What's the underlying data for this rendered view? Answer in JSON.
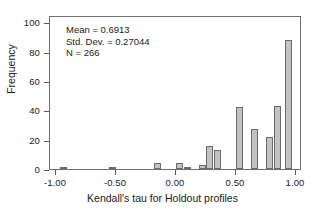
{
  "chart_data": {
    "type": "bar",
    "title": "",
    "subtitle": "",
    "xlabel": "Kendall's tau for Holdout profiles",
    "ylabel": "Frequency",
    "xlim": [
      -1.05,
      1.05
    ],
    "ylim": [
      0,
      105
    ],
    "xticks": [
      -1.0,
      -0.5,
      0.0,
      0.5,
      1.0
    ],
    "xtick_labels": [
      "-1.00",
      "-0.50",
      "0.00",
      "0.50",
      "1.00"
    ],
    "yticks": [
      0,
      20,
      40,
      60,
      80,
      100
    ],
    "ytick_labels": [
      "0",
      "20",
      "40",
      "60",
      "80",
      "100"
    ],
    "grid": false,
    "legend": null,
    "bin_width": 0.0625,
    "bars": [
      {
        "center": -0.938,
        "value": 1
      },
      {
        "center": -0.531,
        "value": 1
      },
      {
        "center": -0.156,
        "value": 4
      },
      {
        "center": 0.031,
        "value": 4
      },
      {
        "center": 0.094,
        "value": 1
      },
      {
        "center": 0.219,
        "value": 3
      },
      {
        "center": 0.281,
        "value": 16
      },
      {
        "center": 0.344,
        "value": 13
      },
      {
        "center": 0.531,
        "value": 42
      },
      {
        "center": 0.656,
        "value": 27
      },
      {
        "center": 0.781,
        "value": 22
      },
      {
        "center": 0.844,
        "value": 43
      },
      {
        "center": 0.938,
        "value": 88
      }
    ],
    "annotations": {
      "mean_label": "Mean = 0.6913",
      "std_dev_label": "Std. Dev. = 0.27044",
      "n_label": "N = 266"
    },
    "colors": {
      "bar_fill": "#c3c3c3",
      "bar_edge": "#6b6b6b",
      "frame": "#6e6e6e",
      "text": "#1a1a1a"
    }
  },
  "caption": {
    "text": ""
  }
}
